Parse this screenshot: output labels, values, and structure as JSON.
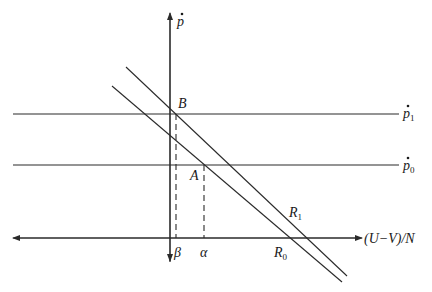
{
  "diagram": {
    "axes": {
      "vertical": {
        "label": "p",
        "dot": true,
        "x": 170,
        "y_top": 12,
        "y_bottom": 262
      },
      "horizontal": {
        "label": "(U−V)/N",
        "y": 238,
        "x_left": 13,
        "x_right": 362
      }
    },
    "horizontal_lines": [
      {
        "id": "p1",
        "label_base": "p",
        "label_sub": "1",
        "y": 114
      },
      {
        "id": "p0",
        "label_base": "p",
        "label_sub": "0",
        "y": 165
      }
    ],
    "curves": [
      {
        "id": "R1",
        "label_base": "R",
        "label_sub": "1",
        "x1": 126,
        "y1": 67,
        "x2": 347,
        "y2": 276
      },
      {
        "id": "R0",
        "label_base": "R",
        "label_sub": "0",
        "x1": 112,
        "y1": 86,
        "x2": 342,
        "y2": 282
      }
    ],
    "points": [
      {
        "id": "B",
        "label": "B",
        "x": 176,
        "y": 114
      },
      {
        "id": "A",
        "label": "A",
        "x": 204,
        "y": 165
      }
    ],
    "axis_marks": [
      {
        "id": "beta",
        "label": "β",
        "x": 176
      },
      {
        "id": "alpha",
        "label": "α",
        "x": 204
      }
    ]
  }
}
